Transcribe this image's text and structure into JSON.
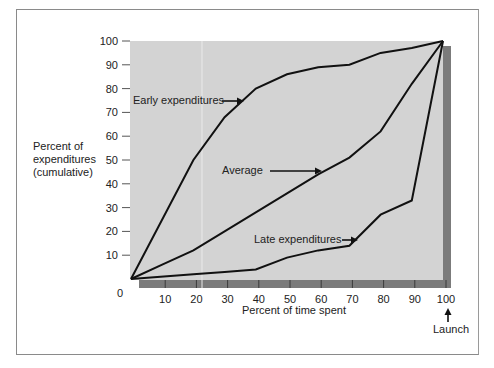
{
  "chart_data": {
    "type": "line",
    "title": "",
    "xlabel": "Percent of time spent",
    "ylabel": "Percent of expenditures (cumulative)",
    "ylabel_lines": [
      "Percent of",
      "expenditures",
      "(cumulative)"
    ],
    "xlim": [
      0,
      100
    ],
    "ylim": [
      0,
      100
    ],
    "x_ticks": [
      10,
      20,
      30,
      40,
      50,
      60,
      70,
      80,
      90,
      100
    ],
    "y_ticks": [
      10,
      20,
      30,
      40,
      50,
      60,
      70,
      80,
      90,
      100
    ],
    "origin_label": "0",
    "grid": false,
    "legend": "none (inline arrow annotations)",
    "series": [
      {
        "name": "Early expenditures",
        "x": [
          0,
          20,
          30,
          40,
          50,
          60,
          70,
          80,
          90,
          100
        ],
        "y": [
          0,
          50,
          68,
          80,
          86,
          89,
          90,
          95,
          97,
          100
        ]
      },
      {
        "name": "Average",
        "x": [
          0,
          10,
          20,
          30,
          40,
          50,
          60,
          70,
          80,
          90,
          100
        ],
        "y": [
          0,
          6,
          12,
          20,
          28,
          36,
          44,
          51,
          62,
          82,
          100
        ]
      },
      {
        "name": "Late expenditures",
        "x": [
          0,
          20,
          30,
          40,
          50,
          60,
          70,
          80,
          90,
          100
        ],
        "y": [
          0,
          2,
          3,
          4,
          9,
          12,
          14,
          27,
          33,
          100
        ]
      }
    ],
    "annotations": [
      {
        "text": "Early expenditures",
        "points_to": "Early expenditures curve"
      },
      {
        "text": "Average",
        "points_to": "Average curve"
      },
      {
        "text": "Late expenditures",
        "points_to": "Late expenditures curve"
      },
      {
        "text": "Launch",
        "points_to": "x = 100"
      }
    ]
  },
  "colors": {
    "plot_bg": "#d3d3d3",
    "shadow": "#7b7b7b",
    "line": "#111111",
    "frame": "#8a8a8a"
  }
}
